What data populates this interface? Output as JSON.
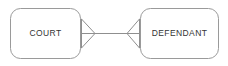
{
  "diagram": {
    "type": "entity-relationship",
    "notation": "crows-foot",
    "background_color": "#ffffff",
    "stroke_color": "#9a9a9a",
    "text_color": "#333333",
    "entities": [
      {
        "id": "court",
        "label": "COURT",
        "x": 10,
        "y": 8,
        "width": 70,
        "height": 51,
        "corner_radius": 10
      },
      {
        "id": "defendant",
        "label": "DEFENDANT",
        "x": 140,
        "y": 8,
        "width": 79,
        "height": 51,
        "corner_radius": 10
      }
    ],
    "relationships": [
      {
        "id": "court-defendant",
        "from": "court",
        "to": "defendant",
        "label": "",
        "line_y": 33,
        "line_x1": 81,
        "line_x2": 140,
        "from_cardinality": "many",
        "to_cardinality": "many"
      }
    ]
  }
}
